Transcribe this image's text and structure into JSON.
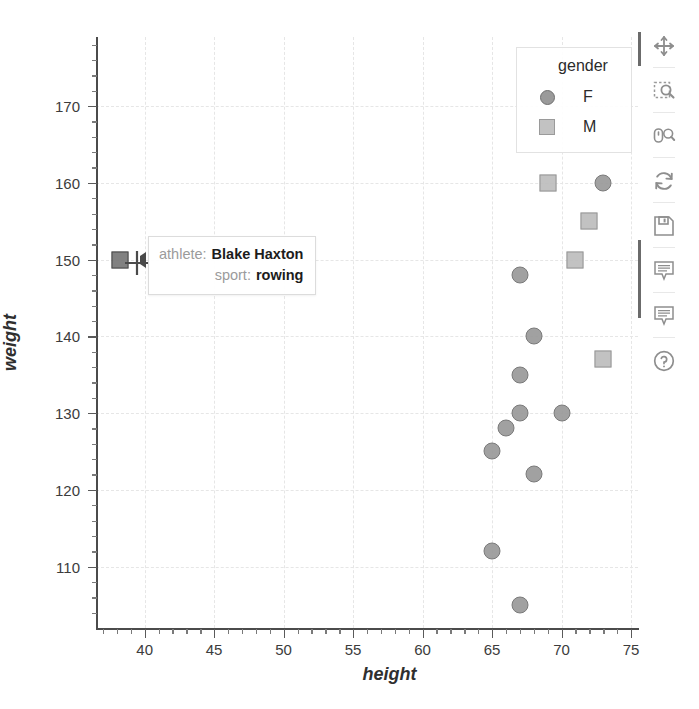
{
  "chart_data": {
    "type": "scatter",
    "title": "",
    "xlabel": "height",
    "ylabel": "weight",
    "xlim": [
      36.5,
      75.5
    ],
    "ylim": [
      102.0,
      179.0
    ],
    "grid": true,
    "legend": {
      "title": "gender",
      "position": "top-right",
      "entries": [
        {
          "label": "F",
          "marker": "circle",
          "color": "#9a9a9a"
        },
        {
          "label": "M",
          "marker": "square",
          "color": "#c2c2c2"
        }
      ]
    },
    "xticks": [
      40,
      45,
      50,
      55,
      60,
      65,
      70,
      75
    ],
    "yticks": [
      110,
      120,
      130,
      140,
      150,
      160,
      170
    ],
    "series": [
      {
        "name": "F",
        "marker": "circle",
        "points": [
          {
            "height": 73,
            "weight": 160
          },
          {
            "height": 67,
            "weight": 148
          },
          {
            "height": 68,
            "weight": 140
          },
          {
            "height": 67,
            "weight": 135
          },
          {
            "height": 67,
            "weight": 130
          },
          {
            "height": 70,
            "weight": 130
          },
          {
            "height": 66,
            "weight": 128
          },
          {
            "height": 65,
            "weight": 125
          },
          {
            "height": 68,
            "weight": 122
          },
          {
            "height": 65,
            "weight": 112
          },
          {
            "height": 67,
            "weight": 105
          }
        ]
      },
      {
        "name": "M",
        "marker": "square",
        "points": [
          {
            "height": 69,
            "weight": 160
          },
          {
            "height": 72,
            "weight": 155
          },
          {
            "height": 71,
            "weight": 150
          },
          {
            "height": 73,
            "weight": 137
          },
          {
            "height": 38.2,
            "weight": 150,
            "hovered": true
          }
        ]
      }
    ]
  },
  "tooltip": {
    "rows": [
      {
        "key": "athlete:",
        "value": "Blake Haxton"
      },
      {
        "key": "sport:",
        "value": "rowing"
      }
    ]
  },
  "toolbar": {
    "tools": [
      {
        "name": "pan-tool",
        "label": "Pan"
      },
      {
        "name": "box-zoom-tool",
        "label": "Box Zoom"
      },
      {
        "name": "wheel-zoom-tool",
        "label": "Wheel Zoom"
      },
      {
        "name": "reset-tool",
        "label": "Reset"
      },
      {
        "name": "save-tool",
        "label": "Save"
      },
      {
        "name": "hover-tool",
        "label": "Hover"
      },
      {
        "name": "hover-tool-2",
        "label": "Hover"
      },
      {
        "name": "help-tool",
        "label": "Help"
      }
    ]
  },
  "colors": {
    "female": "#9a9a9a",
    "male": "#c2c2c2",
    "axis": "#4b4b4b",
    "grid": "#e6e6e6",
    "text": "#2f2f2f"
  }
}
